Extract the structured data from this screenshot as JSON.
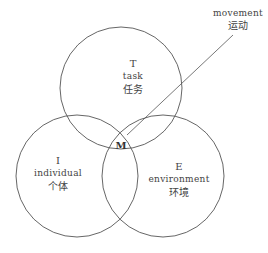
{
  "diagram": {
    "type": "venn",
    "colors": {
      "stroke": "#555555",
      "text": "#444444",
      "background": "#ffffff"
    },
    "circles": [
      {
        "id": "task",
        "letter": "T",
        "en": "task",
        "zh": "任务",
        "cx": 121,
        "cy": 88,
        "r": 61
      },
      {
        "id": "individual",
        "letter": "I",
        "en": "individual",
        "zh": "个体",
        "cx": 77,
        "cy": 176,
        "r": 61
      },
      {
        "id": "environment",
        "letter": "E",
        "en": "environment",
        "zh": "环境",
        "cx": 163,
        "cy": 176,
        "r": 61
      }
    ],
    "intersection": {
      "letter": "M"
    },
    "callout": {
      "en": "movement",
      "zh": "运动",
      "line": {
        "x1": 127,
        "y1": 135,
        "x2": 233,
        "y2": 35
      }
    }
  }
}
